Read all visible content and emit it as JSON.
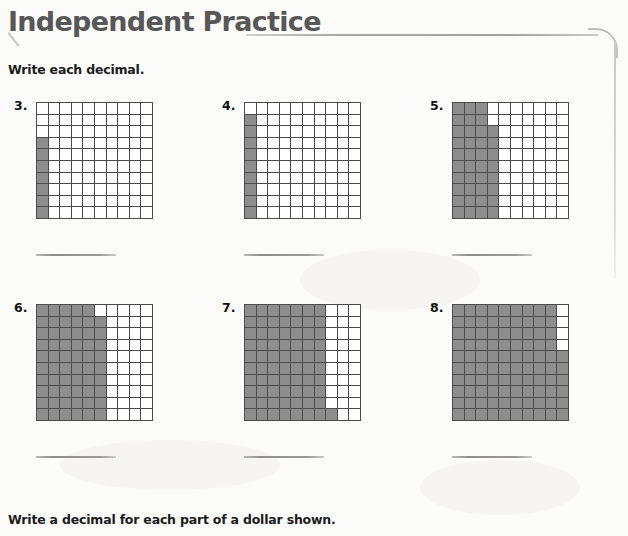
{
  "page": {
    "title": "Independent Practice",
    "instruction_decimal": "Write each decimal.",
    "instruction_dollar": "Write a decimal for each part of a dollar shown.",
    "title_color": "#575757",
    "shade_color": "#8d8d8d",
    "grid_line_color": "#4b4b4b",
    "background_color": "#fbfbfa"
  },
  "problems": [
    {
      "number": "3.",
      "grid": {
        "columns": 10,
        "rows": 10,
        "shaded_count": 7,
        "decimal": "0.07",
        "shaded_cells": [
          [
            3,
            0
          ],
          [
            4,
            0
          ],
          [
            5,
            0
          ],
          [
            6,
            0
          ],
          [
            7,
            0
          ],
          [
            8,
            0
          ],
          [
            9,
            0
          ]
        ]
      }
    },
    {
      "number": "4.",
      "grid": {
        "columns": 10,
        "rows": 10,
        "shaded_count": 9,
        "decimal": "0.09",
        "shaded_cells": [
          [
            1,
            0
          ],
          [
            2,
            0
          ],
          [
            3,
            0
          ],
          [
            4,
            0
          ],
          [
            5,
            0
          ],
          [
            6,
            0
          ],
          [
            7,
            0
          ],
          [
            8,
            0
          ],
          [
            9,
            0
          ]
        ]
      }
    },
    {
      "number": "5.",
      "grid": {
        "columns": 10,
        "rows": 10,
        "shaded_count": 38,
        "decimal": "0.38",
        "full_columns": [
          0,
          1,
          2
        ],
        "partial_column": {
          "index": 3,
          "start_row": 2,
          "end_row": 9
        }
      }
    },
    {
      "number": "6.",
      "grid": {
        "columns": 10,
        "rows": 10,
        "shaded_count": 59,
        "decimal": "0.59",
        "full_columns": [
          0,
          1,
          2,
          3,
          4
        ],
        "partial_column": {
          "index": 5,
          "start_row": 1,
          "end_row": 9
        }
      }
    },
    {
      "number": "7.",
      "grid": {
        "columns": 10,
        "rows": 10,
        "shaded_count": 71,
        "decimal": "0.71",
        "full_columns": [
          0,
          1,
          2,
          3,
          4,
          5,
          6
        ],
        "partial_column": {
          "index": 7,
          "start_row": 9,
          "end_row": 9
        }
      }
    },
    {
      "number": "8.",
      "grid": {
        "columns": 10,
        "rows": 10,
        "shaded_count": 96,
        "decimal": "0.96",
        "full_columns": [
          0,
          1,
          2,
          3,
          4,
          5,
          6,
          7,
          8
        ],
        "partial_column": {
          "index": 9,
          "start_row": 4,
          "end_row": 9
        }
      }
    }
  ],
  "answer_lines": {
    "count": 6,
    "value": ""
  }
}
